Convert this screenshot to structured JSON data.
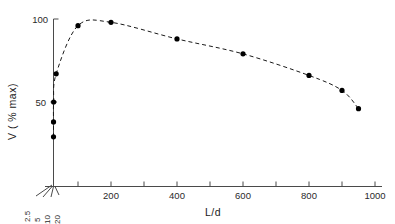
{
  "chart_data": {
    "type": "scatter",
    "title": "",
    "xlabel": "L/d",
    "ylabel": "V ( % max)",
    "xlim": [
      0,
      1000
    ],
    "ylim": [
      0,
      100
    ],
    "grid": false,
    "legend": null,
    "line_style": "dashed",
    "marker": "filled-circle",
    "x": [
      5,
      10,
      20,
      50,
      100,
      200,
      400,
      600,
      800,
      900,
      950
    ],
    "y": [
      29,
      38,
      50,
      67,
      96,
      98,
      88,
      79,
      66,
      57,
      46
    ],
    "points": [
      {
        "x": 5,
        "y": 29
      },
      {
        "x": 10,
        "y": 38
      },
      {
        "x": 20,
        "y": 50
      },
      {
        "x": 50,
        "y": 67
      },
      {
        "x": 100,
        "y": 96
      },
      {
        "x": 200,
        "y": 98
      },
      {
        "x": 400,
        "y": 88
      },
      {
        "x": 600,
        "y": 79
      },
      {
        "x": 800,
        "y": 66
      },
      {
        "x": 900,
        "y": 57
      },
      {
        "x": 950,
        "y": 46
      }
    ],
    "x_tick_labels": [
      "200",
      "400",
      "600",
      "800",
      "1000"
    ],
    "x_tick_values": [
      200,
      400,
      600,
      800,
      1000
    ],
    "x_minor_tick_values": [
      100,
      300,
      500,
      700,
      900
    ],
    "y_tick_labels": [
      "50",
      "100"
    ],
    "y_tick_values": [
      50,
      100
    ],
    "origin_scale_labels": [
      "2.5",
      "5",
      "10",
      "20"
    ],
    "colors": {
      "background": "#ffffff",
      "axis": "#4a4a4a",
      "marker": "#000000",
      "line": "#1a1a1a",
      "text": "#1a1a1a"
    }
  },
  "axes": {
    "y_title": "V ( % max)",
    "x_title": "L/d"
  },
  "y_ticks": [
    {
      "label": "100",
      "value": 100
    },
    {
      "label": "50",
      "value": 50
    }
  ],
  "x_ticks": [
    {
      "label": "200",
      "value": 200
    },
    {
      "label": "400",
      "value": 400
    },
    {
      "label": "600",
      "value": 600
    },
    {
      "label": "800",
      "value": 800
    },
    {
      "label": "1000",
      "value": 1000
    }
  ],
  "origin_ticks": [
    {
      "label": "2.5",
      "value": 2.5
    },
    {
      "label": "5",
      "value": 5
    },
    {
      "label": "10",
      "value": 10
    },
    {
      "label": "20",
      "value": 20
    }
  ]
}
